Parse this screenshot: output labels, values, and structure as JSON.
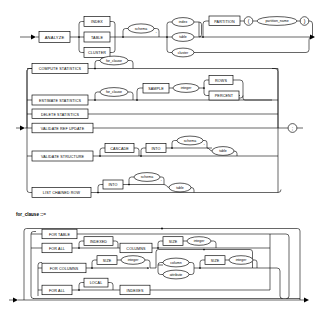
{
  "document": {
    "type": "syntax-railroad-diagram",
    "title": "ANALYZE statement syntax diagram",
    "sections": [
      {
        "id": "analyze",
        "label": ""
      },
      {
        "id": "for_clause",
        "label": "for_clause ::="
      }
    ]
  },
  "section1": {
    "start_keyword": "ANALYZE",
    "object_types": [
      "INDEX",
      "TABLE",
      "CLUSTER"
    ],
    "schema_ph": "schema",
    "dot": ".",
    "names": [
      "index",
      "table",
      "cluster"
    ],
    "partition_keyword": "PARTITION",
    "paren_open": "(",
    "partition_name_ph": "partition_name",
    "paren_close": ")"
  },
  "section2": {
    "operations": [
      "COMPUTE STATISTICS",
      "ESTIMATE STATISTICS",
      "DELETE STATISTICS",
      "VALIDATE REF UPDATE",
      "VALIDATE STRUCTURE",
      "LIST CHAINED ROW"
    ],
    "for_clause_ph": "for_clause",
    "sample_keyword": "SAMPLE",
    "integer_ph": "integer",
    "sample_units": [
      "ROWS",
      "PERCENT"
    ],
    "cascade_keyword": "CASCADE",
    "into_keyword": "INTO",
    "schema_ph": "schema",
    "dot": ".",
    "table_ph": "table",
    "terminator": ";"
  },
  "section3": {
    "label": "for_clause ::=",
    "branches": [
      {
        "keyword": "FOR TABLE"
      },
      {
        "keyword": "FOR ALL",
        "opt": "INDEXED",
        "then": "COLUMNS",
        "size": "SIZE",
        "integer": "integer"
      },
      {
        "keyword": "FOR COLUMNS",
        "size": "SIZE",
        "integer": "integer",
        "items": [
          "column",
          "attribute"
        ],
        "size2": "SIZE",
        "integer2": "integer"
      },
      {
        "keyword": "FOR ALL",
        "opt": "LOCAL",
        "then": "INDEXES"
      }
    ],
    "indexed_keyword": "INDEXED",
    "columns_keyword": "COLUMNS",
    "size_keyword": "SIZE",
    "integer_ph": "integer",
    "column_ph": "column",
    "attribute_ph": "attribute",
    "local_keyword": "LOCAL",
    "indexes_keyword": "INDEXES"
  },
  "colors": {
    "line": "#000000",
    "fill": "#ffffff",
    "background": "#ffffff"
  }
}
